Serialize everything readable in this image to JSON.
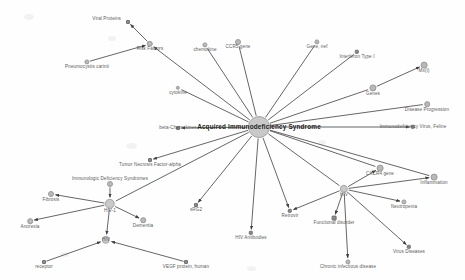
{
  "graph": {
    "title": "Acquired Immunodeficiency Syndrome",
    "type": "node-link-network",
    "colors": {
      "node": "#b9b9b9",
      "hub_node": "#c9c9c9",
      "leaf_node": "#8c8c8c",
      "edge": "#4a4a4a",
      "label": "#5d5d5d",
      "center_label": "#1d1d1d",
      "background": "#fefefe"
    },
    "nodes": [
      {
        "id": "aids",
        "label": "Acquired Immunodeficiency Syndrome",
        "x": 259,
        "y": 127,
        "r": 11,
        "kind": "hub",
        "label_dx": 0,
        "label_dy": 0,
        "align": "center"
      },
      {
        "id": "viral_proteins",
        "label": "Viral Proteins",
        "x": 128,
        "y": 22,
        "r": 2,
        "kind": "square",
        "label_dx": -7,
        "label_dy": -3,
        "align": "right"
      },
      {
        "id": "risk_factors",
        "label": "Risk Factors",
        "x": 150,
        "y": 44,
        "r": 3.2,
        "kind": "node",
        "label_dx": 0,
        "label_dy": 5,
        "align": "center"
      },
      {
        "id": "pneumocystis",
        "label": "Pneumocystis carinii",
        "x": 87,
        "y": 62,
        "r": 2.6,
        "kind": "node",
        "label_dx": 0,
        "label_dy": 5,
        "align": "center"
      },
      {
        "id": "chemokine",
        "label": "chemokine",
        "x": 205,
        "y": 45,
        "r": 2.6,
        "kind": "node",
        "label_dx": 0,
        "label_dy": 5,
        "align": "center"
      },
      {
        "id": "ccr5_gene",
        "label": "CCR5 gene",
        "x": 238,
        "y": 42,
        "r": 3.0,
        "kind": "node",
        "label_dx": 0,
        "label_dy": 5,
        "align": "center"
      },
      {
        "id": "gene_nef",
        "label": "Gene, nef",
        "x": 317,
        "y": 42,
        "r": 2.6,
        "kind": "node",
        "label_dx": 0,
        "label_dy": 5,
        "align": "center"
      },
      {
        "id": "interferon",
        "label": "Interferon Type I",
        "x": 357,
        "y": 52,
        "r": 2.2,
        "kind": "square",
        "label_dx": 0,
        "label_dy": 5,
        "align": "center"
      },
      {
        "id": "cytokine",
        "label": "cytokine",
        "x": 178,
        "y": 88,
        "r": 2.2,
        "kind": "node",
        "label_dx": 0,
        "label_dy": 5,
        "align": "center"
      },
      {
        "id": "mxi",
        "label": "Mx(I)",
        "x": 424,
        "y": 65,
        "r": 3.4,
        "kind": "node",
        "label_dx": 0,
        "label_dy": 6,
        "align": "center"
      },
      {
        "id": "genes",
        "label": "Genes",
        "x": 373,
        "y": 88,
        "r": 3.6,
        "kind": "node",
        "label_dx": 0,
        "label_dy": 6,
        "align": "center"
      },
      {
        "id": "disease_prog",
        "label": "Disease Progression",
        "x": 427,
        "y": 104,
        "r": 2.8,
        "kind": "node",
        "label_dx": 0,
        "label_dy": 6,
        "align": "center"
      },
      {
        "id": "beta_chemokines",
        "label": "beta-Chemokines",
        "x": 178,
        "y": 128,
        "r": 2.0,
        "kind": "square",
        "label_dx": 0,
        "label_dy": 0,
        "align": "center"
      },
      {
        "id": "fiv",
        "label": "Immunodeficiency Virus, Feline",
        "x": 413,
        "y": 127,
        "r": 2.2,
        "kind": "square",
        "label_dx": 0,
        "label_dy": 0,
        "align": "center"
      },
      {
        "id": "cxcr4_gene",
        "label": "CXCR4 gene",
        "x": 380,
        "y": 168,
        "r": 3.4,
        "kind": "node",
        "label_dx": 0,
        "label_dy": 6,
        "align": "center"
      },
      {
        "id": "inflammation",
        "label": "Inflammation",
        "x": 434,
        "y": 177,
        "r": 3.4,
        "kind": "node",
        "label_dx": 0,
        "label_dy": 6,
        "align": "center"
      },
      {
        "id": "tnf_alpha",
        "label": "Tumor Necrosis Factor-alpha",
        "x": 150,
        "y": 160,
        "r": 2.0,
        "kind": "square",
        "label_dx": 0,
        "label_dy": 5,
        "align": "center"
      },
      {
        "id": "ids",
        "label": "Immunologic Deficiency Syndromes",
        "x": 110,
        "y": 184,
        "r": 3.0,
        "kind": "node",
        "label_dx": 0,
        "label_dy": -5,
        "align": "center"
      },
      {
        "id": "hiv1",
        "label": "HIV-1",
        "x": 110,
        "y": 204,
        "r": 5.2,
        "kind": "hub",
        "label_dx": 0,
        "label_dy": 7,
        "align": "center"
      },
      {
        "id": "fibrosis",
        "label": "Fibrosis",
        "x": 51,
        "y": 194,
        "r": 3.0,
        "kind": "node",
        "label_dx": 0,
        "label_dy": 6,
        "align": "center"
      },
      {
        "id": "anorexia",
        "label": "Anorexia",
        "x": 30,
        "y": 221,
        "r": 2.8,
        "kind": "node",
        "label_dx": 0,
        "label_dy": 6,
        "align": "center"
      },
      {
        "id": "dementia",
        "label": "Dementia",
        "x": 143,
        "y": 220,
        "r": 2.8,
        "kind": "node",
        "label_dx": 0,
        "label_dy": 6,
        "align": "center"
      },
      {
        "id": "hiv",
        "label": "HIV",
        "x": 106,
        "y": 240,
        "r": 4.2,
        "kind": "hub",
        "label_dx": 0,
        "label_dy": 0,
        "align": "center"
      },
      {
        "id": "receptor",
        "label": "receptor",
        "x": 44,
        "y": 262,
        "r": 2.0,
        "kind": "square",
        "label_dx": 0,
        "label_dy": 5,
        "align": "center"
      },
      {
        "id": "vegf",
        "label": "VEGF protein, human",
        "x": 186,
        "y": 262,
        "r": 2.0,
        "kind": "square",
        "label_dx": 0,
        "label_dy": 5,
        "align": "center"
      },
      {
        "id": "sirg2",
        "label": "sRG2",
        "x": 196,
        "y": 205,
        "r": 2.0,
        "kind": "square",
        "label_dx": 0,
        "label_dy": 5,
        "align": "center"
      },
      {
        "id": "hiv_antibodies",
        "label": "HIV Antibodies",
        "x": 251,
        "y": 233,
        "r": 2.2,
        "kind": "square",
        "label_dx": 0,
        "label_dy": 5,
        "align": "center"
      },
      {
        "id": "retrovir",
        "label": "Retrovir",
        "x": 290,
        "y": 211,
        "r": 2.2,
        "kind": "square",
        "label_dx": 0,
        "label_dy": 5,
        "align": "center"
      },
      {
        "id": "hiv_hub",
        "label": "HIV",
        "x": 344,
        "y": 189,
        "r": 4.2,
        "kind": "hub",
        "label_dx": 0,
        "label_dy": 6,
        "align": "center"
      },
      {
        "id": "func_disorder",
        "label": "Functional disorder",
        "x": 334,
        "y": 218,
        "r": 2.4,
        "kind": "square",
        "label_dx": 0,
        "label_dy": 5,
        "align": "center"
      },
      {
        "id": "neutropenia",
        "label": "Neutropenia",
        "x": 404,
        "y": 202,
        "r": 2.6,
        "kind": "node",
        "label_dx": 0,
        "label_dy": 5,
        "align": "center"
      },
      {
        "id": "virus_diseases",
        "label": "Virus Diseases",
        "x": 409,
        "y": 247,
        "r": 2.2,
        "kind": "square",
        "label_dx": 0,
        "label_dy": 5,
        "align": "center"
      },
      {
        "id": "chronic_inf",
        "label": "Chronic infectious disease",
        "x": 348,
        "y": 262,
        "r": 2.6,
        "kind": "node",
        "label_dx": 0,
        "label_dy": 5,
        "align": "center"
      }
    ],
    "edges": [
      {
        "from": "aids",
        "to": "viral_proteins_via_risk",
        "source": "risk_factors",
        "target": "viral_proteins",
        "arrow": "target"
      },
      {
        "source": "pneumocystis",
        "target": "risk_factors",
        "arrow": "target"
      },
      {
        "source": "aids",
        "target": "risk_factors",
        "arrow": "target"
      },
      {
        "source": "aids",
        "target": "chemokine",
        "arrow": "none"
      },
      {
        "source": "aids",
        "target": "ccr5_gene",
        "arrow": "none"
      },
      {
        "source": "aids",
        "target": "gene_nef",
        "arrow": "none"
      },
      {
        "source": "aids",
        "target": "interferon",
        "arrow": "none"
      },
      {
        "source": "aids",
        "target": "cytokine",
        "arrow": "none"
      },
      {
        "source": "aids",
        "target": "genes",
        "arrow": "none"
      },
      {
        "source": "genes",
        "target": "mxi",
        "arrow": "target"
      },
      {
        "source": "aids",
        "target": "disease_prog",
        "arrow": "none"
      },
      {
        "source": "aids",
        "target": "beta_chemokines",
        "arrow": "target"
      },
      {
        "source": "aids",
        "target": "fiv",
        "arrow": "target"
      },
      {
        "source": "aids",
        "target": "cxcr4_gene",
        "arrow": "none"
      },
      {
        "source": "aids",
        "target": "inflammation",
        "arrow": "none"
      },
      {
        "source": "aids",
        "target": "tnf_alpha",
        "arrow": "target"
      },
      {
        "source": "aids",
        "target": "sirg2",
        "arrow": "target"
      },
      {
        "source": "aids",
        "target": "hiv_antibodies",
        "arrow": "target"
      },
      {
        "source": "aids",
        "target": "retrovir",
        "arrow": "target"
      },
      {
        "source": "aids",
        "target": "hiv_hub",
        "arrow": "none"
      },
      {
        "source": "aids",
        "target": "hiv1",
        "arrow": "none"
      },
      {
        "source": "ids",
        "target": "hiv1",
        "arrow": "target"
      },
      {
        "source": "hiv1",
        "target": "fibrosis",
        "arrow": "target"
      },
      {
        "source": "hiv1",
        "target": "anorexia",
        "arrow": "target"
      },
      {
        "source": "hiv1",
        "target": "dementia",
        "arrow": "target"
      },
      {
        "source": "hiv1",
        "target": "hiv",
        "arrow": "target"
      },
      {
        "source": "receptor",
        "target": "hiv",
        "arrow": "target"
      },
      {
        "source": "vegf",
        "target": "hiv",
        "arrow": "target"
      },
      {
        "source": "hiv_hub",
        "target": "cxcr4_gene",
        "arrow": "target"
      },
      {
        "source": "hiv_hub",
        "target": "inflammation",
        "arrow": "target"
      },
      {
        "source": "hiv_hub",
        "target": "neutropenia",
        "arrow": "target"
      },
      {
        "source": "hiv_hub",
        "target": "func_disorder",
        "arrow": "target"
      },
      {
        "source": "hiv_hub",
        "target": "virus_diseases",
        "arrow": "target"
      },
      {
        "source": "hiv_hub",
        "target": "chronic_inf",
        "arrow": "target"
      },
      {
        "source": "hiv_hub",
        "target": "retrovir",
        "arrow": "target"
      }
    ]
  }
}
